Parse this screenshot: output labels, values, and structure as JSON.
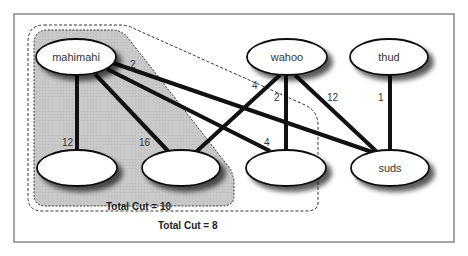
{
  "diagram": {
    "type": "graph-partition",
    "nodes": [
      {
        "id": "mahimahi",
        "label": "mahimahi",
        "cx": 76,
        "cy": 57
      },
      {
        "id": "wahoo",
        "label": "wahoo",
        "cx": 287,
        "cy": 57
      },
      {
        "id": "thud",
        "label": "thud",
        "cx": 389,
        "cy": 57
      },
      {
        "id": "n1",
        "label": "",
        "cx": 77,
        "cy": 168
      },
      {
        "id": "n2",
        "label": "",
        "cx": 181,
        "cy": 168
      },
      {
        "id": "n3",
        "label": "",
        "cx": 286,
        "cy": 168
      },
      {
        "id": "suds",
        "label": "suds",
        "cx": 390,
        "cy": 168
      }
    ],
    "edges": [
      {
        "from": "mahimahi",
        "to": "n1",
        "weight": "12"
      },
      {
        "from": "mahimahi",
        "to": "n2",
        "weight": "16"
      },
      {
        "from": "mahimahi",
        "to": "n3",
        "weight": "4"
      },
      {
        "from": "mahimahi",
        "to": "suds",
        "weight": "2"
      },
      {
        "from": "wahoo",
        "to": "n2",
        "weight": "4"
      },
      {
        "from": "wahoo",
        "to": "n3",
        "weight": "2"
      },
      {
        "from": "wahoo",
        "to": "suds",
        "weight": "12"
      },
      {
        "from": "thud",
        "to": "suds",
        "weight": "1"
      }
    ],
    "partitions": [
      {
        "label": "Total Cut = 10",
        "members": [
          "mahimahi",
          "n1",
          "n2"
        ],
        "fill": "#c8c8c8"
      },
      {
        "label": "Total Cut = 8",
        "members": [
          "mahimahi",
          "n1",
          "n2",
          "n3"
        ],
        "fill": "none"
      }
    ],
    "colors": {
      "frame": "#808080",
      "edge": "#111111",
      "shade": "#c8c8c8",
      "node_fill": "#ffffff"
    }
  }
}
